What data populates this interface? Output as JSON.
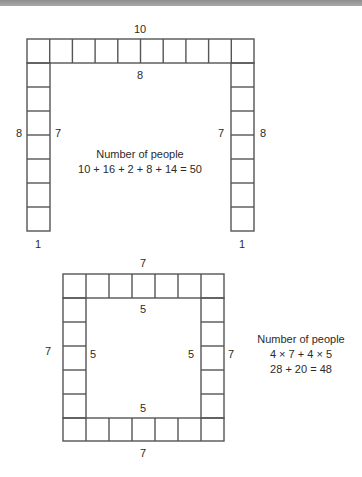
{
  "figure_top": {
    "name": "U-shaped seating arrangement",
    "labels": {
      "top_outer": "10",
      "top_inner": "8",
      "left_outer": "8",
      "left_inner": "7",
      "right_inner": "7",
      "right_outer": "8",
      "left_bottom": "1",
      "right_bottom": "1"
    },
    "caption": {
      "title": "Number of people",
      "equation": "10 + 16 + 2 + 8 + 14 = 50"
    },
    "grid": {
      "top_row_cells": 10,
      "side_column_cells_below_top": 7
    }
  },
  "figure_bottom": {
    "name": "Square seating arrangement",
    "labels": {
      "top_outer": "7",
      "top_inner": "5",
      "left_outer": "7",
      "left_inner": "5",
      "right_inner": "5",
      "right_outer": "7",
      "bottom_inner": "5",
      "bottom_outer": "7"
    },
    "caption": {
      "title": "Number of people",
      "line1": "4 × 7 + 4 × 5",
      "line2": "28 + 20 = 48"
    },
    "grid": {
      "cells_per_side": 7
    }
  },
  "colors": {
    "line": "#555555",
    "text": "#2b2b2b",
    "top_band": "#9a9a9a"
  }
}
